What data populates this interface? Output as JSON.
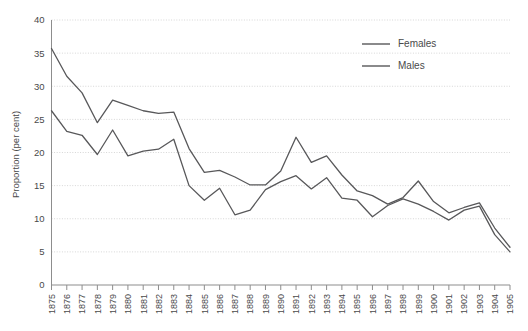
{
  "chart_data": {
    "type": "line",
    "title": "",
    "subtitle": "",
    "xlabel": "",
    "ylabel": "Proportion (per cent)",
    "xlim": [
      1875,
      1905
    ],
    "ylim": [
      0,
      40
    ],
    "ytick_step": 5,
    "yticks": [
      0,
      5,
      10,
      15,
      20,
      25,
      30,
      35,
      40
    ],
    "grid": true,
    "grid_axis": "y",
    "legend_position": "top-right",
    "categories": [
      "1875",
      "1876",
      "1877",
      "1878",
      "1879",
      "1880",
      "1881",
      "1882",
      "1883",
      "1884",
      "1885",
      "1886",
      "1887",
      "1888",
      "1889",
      "1890",
      "1891",
      "1892",
      "1893",
      "1894",
      "1895",
      "1896",
      "1897",
      "1898",
      "1899",
      "1900",
      "1901",
      "1902",
      "1903",
      "1904",
      "1905"
    ],
    "series": [
      {
        "name": "Females",
        "color": "#58585a",
        "values": [
          35.7,
          31.5,
          29.0,
          24.5,
          27.9,
          27.1,
          26.3,
          25.9,
          26.1,
          20.6,
          17.0,
          17.3,
          16.3,
          15.1,
          15.1,
          17.2,
          22.3,
          18.5,
          19.5,
          16.6,
          14.2,
          13.5,
          12.2,
          13.2,
          15.7,
          12.6,
          10.9,
          11.7,
          12.4,
          8.6,
          5.7
        ]
      },
      {
        "name": "Males",
        "color": "#58585a",
        "values": [
          26.3,
          23.2,
          22.6,
          19.7,
          23.4,
          19.5,
          20.2,
          20.5,
          22.0,
          15.0,
          12.8,
          14.6,
          10.6,
          11.3,
          14.4,
          15.6,
          16.5,
          14.5,
          16.2,
          13.1,
          12.8,
          10.3,
          12.0,
          13.0,
          12.2,
          11.1,
          9.8,
          11.3,
          11.9,
          7.6,
          5.0
        ]
      }
    ],
    "legend": [
      {
        "label": "Females"
      },
      {
        "label": "Males"
      }
    ]
  },
  "colors": {
    "background": "#ffffff",
    "line": "#58585a",
    "grid": "#d6d6d6",
    "axis": "#8d8d8d",
    "text": "#4a4a4a"
  }
}
